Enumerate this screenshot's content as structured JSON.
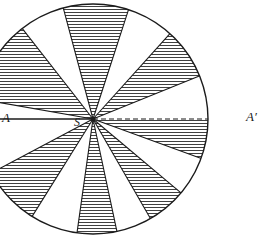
{
  "figure": {
    "kind": "geometric-diagram",
    "background_color": "#ffffff",
    "ink_color": "#1b1b1b",
    "hatch_color": "#2a2a2a",
    "canvas": {
      "width": 263,
      "height": 241
    }
  },
  "labels": {
    "left_endpoint": "A",
    "right_endpoint": "A′",
    "centre": "S"
  },
  "circle": {
    "centre_x": 93,
    "centre_y": 119,
    "radius": 115,
    "stroke_width": 1.4
  },
  "axis": {
    "name": "diameter-AA-prime",
    "left_x": -22,
    "right_x": 208,
    "y": 119,
    "left_segment_style": "solid",
    "right_segment_style": "dashed",
    "dash_pattern": "5 3"
  },
  "chart_data": {
    "type": "pie",
    "angle_unit": "degrees",
    "angle_reference": "0° at A′ (right), measured counter-clockwise",
    "sectors": [
      {
        "index": 1,
        "start": 0,
        "end": 22,
        "sweep": 22,
        "fill": "blank"
      },
      {
        "index": 2,
        "start": 22,
        "end": 48,
        "sweep": 26,
        "fill": "hatched"
      },
      {
        "index": 3,
        "start": 48,
        "end": 72,
        "sweep": 24,
        "fill": "blank"
      },
      {
        "index": 4,
        "start": 72,
        "end": 105,
        "sweep": 33,
        "fill": "hatched"
      },
      {
        "index": 5,
        "start": 105,
        "end": 128,
        "sweep": 23,
        "fill": "blank"
      },
      {
        "index": 6,
        "start": 128,
        "end": 170,
        "sweep": 42,
        "fill": "hatched"
      },
      {
        "index": 7,
        "start": 170,
        "end": 180,
        "sweep": 10,
        "fill": "blank"
      },
      {
        "index": 8,
        "start": 180,
        "end": 208,
        "sweep": 28,
        "fill": "blank"
      },
      {
        "index": 9,
        "start": 208,
        "end": 238,
        "sweep": 30,
        "fill": "hatched"
      },
      {
        "index": 10,
        "start": 238,
        "end": 262,
        "sweep": 24,
        "fill": "blank"
      },
      {
        "index": 11,
        "start": 262,
        "end": 282,
        "sweep": 20,
        "fill": "hatched"
      },
      {
        "index": 12,
        "start": 282,
        "end": 300,
        "sweep": 18,
        "fill": "blank"
      },
      {
        "index": 13,
        "start": 300,
        "end": 320,
        "sweep": 20,
        "fill": "hatched"
      },
      {
        "index": 14,
        "start": 320,
        "end": 340,
        "sweep": 20,
        "fill": "blank"
      },
      {
        "index": 15,
        "start": 340,
        "end": 360,
        "sweep": 20,
        "fill": "hatched"
      }
    ],
    "hatch": {
      "orientation": "horizontal",
      "spacing_px": 3,
      "line_width": 0.8
    },
    "legend": null,
    "grid": false,
    "xlabel": "",
    "ylabel": ""
  }
}
